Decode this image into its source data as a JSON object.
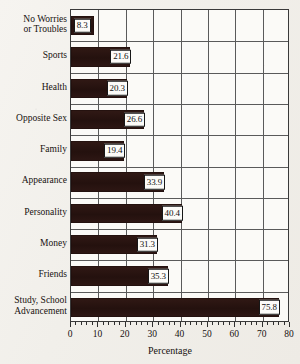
{
  "chart_data": {
    "type": "bar",
    "orientation": "horizontal",
    "title": "",
    "xlabel": "Percentage",
    "ylabel": "",
    "xlim": [
      0,
      80
    ],
    "xticks": [
      0,
      10,
      20,
      30,
      40,
      50,
      60,
      70,
      80
    ],
    "minor_tick_step": 2,
    "grid": "vertical-and-row-separators",
    "legend": "none",
    "bar_color": "#2b1613",
    "value_label_box_color": "#fcfbf8",
    "categories": [
      "No Worries\nor Troubles",
      "Sports",
      "Health",
      "Opposite Sex",
      "Family",
      "Appearance",
      "Personality",
      "Money",
      "Friends",
      "Study, School\nAdvancement"
    ],
    "values": [
      8.3,
      21.6,
      20.3,
      26.6,
      19.4,
      33.9,
      40.4,
      31.3,
      35.3,
      75.8
    ],
    "value_labels": [
      "8.3",
      "21.6",
      "20.3",
      "26.6",
      "19.4",
      "33.9",
      "40.4",
      "31.3",
      "35.3",
      "75.8"
    ]
  }
}
